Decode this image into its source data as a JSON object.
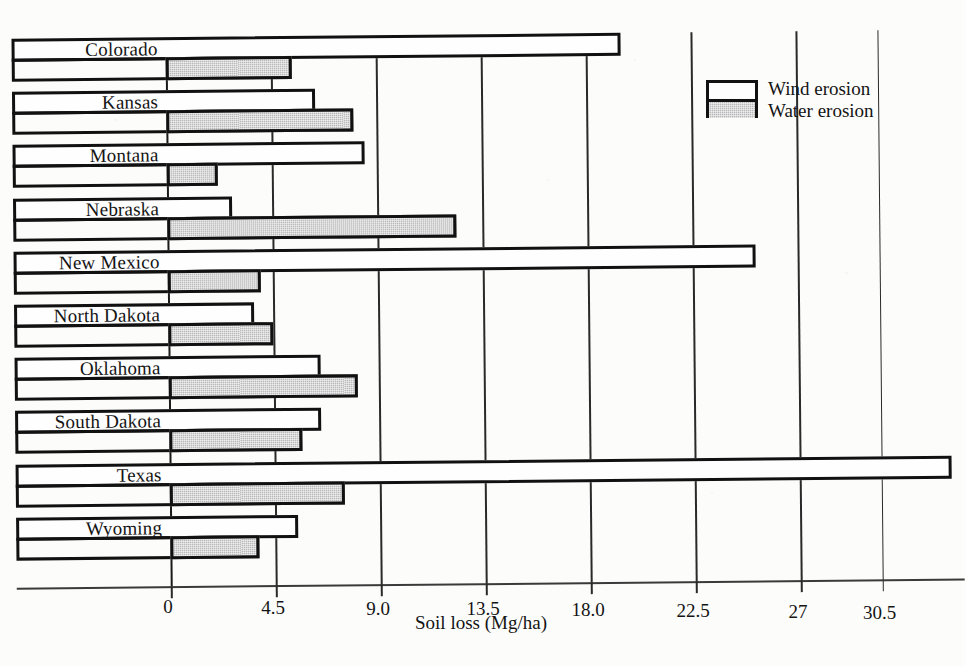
{
  "chart_data": {
    "type": "bar",
    "orientation": "horizontal",
    "title": "",
    "xlabel": "Soil loss (Mg/ha)",
    "ylabel": "",
    "categories": [
      "Colorado",
      "Kansas",
      "Montana",
      "Nebraska",
      "New Mexico",
      "North Dakota",
      "Oklahoma",
      "South Dakota",
      "Texas",
      "Wyoming"
    ],
    "series": [
      {
        "name": "Wind erosion",
        "color": "#ffffff",
        "values": [
          19.5,
          6.4,
          8.5,
          2.8,
          25.2,
          3.7,
          6.5,
          6.5,
          33.5,
          5.5
        ]
      },
      {
        "name": "Water erosion",
        "color": "#b9b9b9",
        "values": [
          5.4,
          8.0,
          2.2,
          12.4,
          4.0,
          4.5,
          8.1,
          5.7,
          7.5,
          3.8
        ]
      }
    ],
    "xticks": [
      0,
      4.5,
      9.0,
      13.5,
      18.0,
      22.5,
      27,
      30.5
    ],
    "xtick_labels": [
      "0",
      "4.5",
      "9.0",
      "13.5",
      "18.0",
      "22.5",
      "27",
      "30.5"
    ],
    "xlim": [
      0,
      33.9
    ],
    "grid": "vertical",
    "legend_position": "top-right",
    "legend_entries": [
      "Wind erosion",
      "Water erosion"
    ]
  },
  "legend": {
    "wind_label": "Wind erosion",
    "water_label": "Water erosion"
  },
  "axis": {
    "x_title": "Soil loss (Mg/ha)"
  }
}
